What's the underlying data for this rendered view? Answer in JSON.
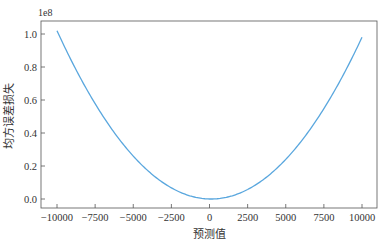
{
  "chart_data": {
    "type": "line",
    "title": "",
    "xlabel": "预测值",
    "ylabel": "均方误差损失",
    "y_offset_label": "1e8",
    "xlim": [
      -11000,
      11000
    ],
    "ylim": [
      -0.03,
      1.07
    ],
    "x_ticks": [
      -10000,
      -7500,
      -5000,
      -2500,
      0,
      2500,
      5000,
      7500,
      10000
    ],
    "x_tick_labels": [
      "−10000",
      "−7500",
      "−5000",
      "−2500",
      "0",
      "2500",
      "5000",
      "7500",
      "10000"
    ],
    "y_ticks": [
      0.0,
      0.2,
      0.4,
      0.6,
      0.8,
      1.0
    ],
    "y_tick_labels": [
      "0.0",
      "0.2",
      "0.4",
      "0.6",
      "0.8",
      "1.0"
    ],
    "grid": false,
    "legend": null,
    "series": [
      {
        "name": "MSE loss",
        "color": "#5aa7de",
        "formula": "(x - 100)^2 / 1e8",
        "x": [
          -10000,
          -7500,
          -5000,
          -2500,
          0,
          2500,
          5000,
          7500,
          10000
        ],
        "y": [
          1.02,
          0.578,
          0.26,
          0.068,
          0.0001,
          0.058,
          0.24,
          0.548,
          0.98
        ]
      }
    ]
  },
  "plot_area": {
    "left": 41,
    "right": 377,
    "top": 21,
    "bottom": 208
  },
  "x_tick_px": [
    57,
    96,
    134,
    172,
    210,
    248,
    286,
    324,
    362
  ],
  "y_tick_px": [
    199,
    166,
    133,
    100,
    67,
    34
  ]
}
